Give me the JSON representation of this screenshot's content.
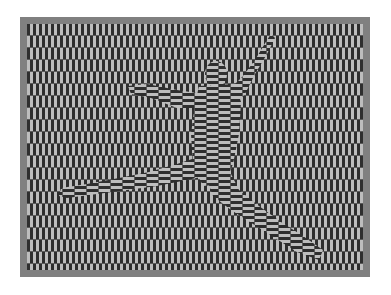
{
  "image": {
    "subject": "dancer-leap-optical-illusion",
    "colors": {
      "page_background": "#ffffff",
      "frame": "#808080",
      "stripe_dark": "#2e2e2e",
      "stripe_light": "#bdbdbd"
    },
    "pattern": {
      "background_orientation": "vertical",
      "figure_orientation": "horizontal",
      "stripe_width_px": 3,
      "row_height_px": 12
    }
  }
}
